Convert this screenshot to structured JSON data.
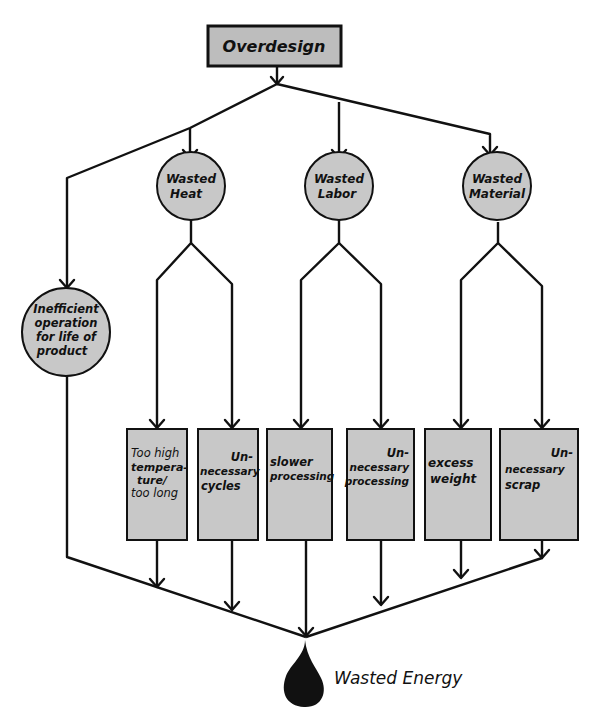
{
  "colors": {
    "background": "#ffffff",
    "node_fill": "#c8c8c8",
    "stroke": "#111111",
    "drop": "#111111"
  },
  "root": {
    "label": "Overdesign"
  },
  "categories": [
    {
      "id": "heat",
      "lines": [
        "Wasted",
        "Heat"
      ]
    },
    {
      "id": "labor",
      "lines": [
        "Wasted",
        "Labor"
      ]
    },
    {
      "id": "material",
      "lines": [
        "Wasted",
        "Material"
      ]
    }
  ],
  "inefficient": {
    "lines": [
      "Inefficient",
      "operation",
      "for life of",
      "product"
    ]
  },
  "causes": [
    {
      "parent": "heat",
      "lines": [
        "Too high",
        "tempera-",
        "ture/",
        "too long"
      ]
    },
    {
      "parent": "heat",
      "lines": [
        "Un-",
        "necessary",
        "cycles"
      ]
    },
    {
      "parent": "labor",
      "lines": [
        "slower",
        "processing"
      ]
    },
    {
      "parent": "labor",
      "lines": [
        "Un-",
        "necessary",
        "processing"
      ]
    },
    {
      "parent": "material",
      "lines": [
        "excess",
        "weight"
      ]
    },
    {
      "parent": "material",
      "lines": [
        "Un-",
        "necessary",
        "scrap"
      ]
    }
  ],
  "result": {
    "label": "Wasted Energy",
    "icon": "drop-icon"
  }
}
